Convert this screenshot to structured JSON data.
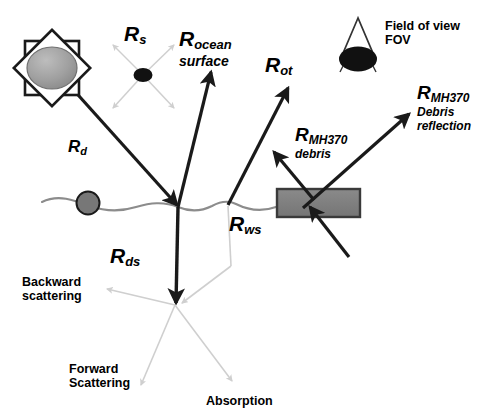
{
  "figure": {
    "type": "scientific-diagram",
    "background_color": "#ffffff",
    "width": 486,
    "height": 419
  },
  "colors": {
    "ray_dark": "#1a1a1a",
    "ray_light": "#cfcfcf",
    "sun_fill": "#9a9a9a",
    "sun_outline": "#1a1a1a",
    "debris_fill": "#808080",
    "debris_outline": "#3a3a3a",
    "float_fill": "#777777",
    "float_outline": "#1a1a1a",
    "wave_line": "#8c8c8c",
    "scatter_dot": "#111111",
    "fov_fill": "#111111",
    "text": "#000000"
  },
  "labels": {
    "r_s": {
      "main": "R",
      "sub": "s",
      "line2": ""
    },
    "r_ocean_surface": {
      "main": "R",
      "sub": "ocean",
      "line2": "surface"
    },
    "r_ot": {
      "main": "R",
      "sub": "ot",
      "line2": ""
    },
    "r_d": {
      "main": "R",
      "sub": "d",
      "line2": ""
    },
    "r_ds": {
      "main": "R",
      "sub": "ds",
      "line2": ""
    },
    "r_ws": {
      "main": "R",
      "sub": "ws",
      "line2": ""
    },
    "r_mh370_debris": {
      "main": "R",
      "sub": "MH370",
      "line2": "debris"
    },
    "r_mh370_debris_reflection": {
      "main": "R",
      "sub": "MH370",
      "line2": "Debris reflection"
    },
    "field_of_view": {
      "line1": "Field of view",
      "line2": "FOV"
    },
    "backward_scattering": {
      "line1": "Backward",
      "line2": "scattering"
    },
    "forward_scattering": {
      "line1": "Forward",
      "line2": "Scattering"
    },
    "absorption": {
      "line1": "Absorption",
      "line2": ""
    }
  },
  "icon_names": {
    "sun": "sun-icon",
    "fov": "field-of-view-cone-icon",
    "debris": "mh370-debris-icon",
    "floating_object": "floating-object-icon",
    "scatter_particle": "scattering-particle-icon",
    "ocean_surface": "ocean-surface-wave-line"
  },
  "geometry": {
    "sun_center": [
      52,
      68
    ],
    "sun_radius": 25,
    "surface_reflection_point": [
      178,
      207
    ],
    "ocean_transmission_point": [
      228,
      203
    ],
    "scatter_point": [
      175,
      305
    ],
    "debris_rect": [
      277,
      189,
      83,
      28
    ],
    "floating_object": [
      88,
      202,
      11
    ],
    "scatter_particle": [
      143,
      75
    ],
    "fov_ellipse": [
      358,
      59
    ]
  }
}
